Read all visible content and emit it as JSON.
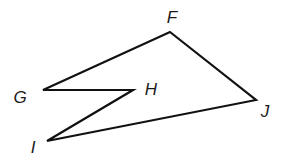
{
  "figure": {
    "type": "polygon",
    "stroke_color": "#111111",
    "stroke_width": 2.2,
    "fill": "none",
    "vertices": [
      {
        "name": "F",
        "x": 170,
        "y": 32,
        "label_x": 172,
        "label_y": 17
      },
      {
        "name": "J",
        "x": 256,
        "y": 100,
        "label_x": 265,
        "label_y": 111
      },
      {
        "name": "I",
        "x": 47,
        "y": 141,
        "label_x": 33,
        "label_y": 147
      },
      {
        "name": "H",
        "x": 133,
        "y": 90,
        "label_x": 151,
        "label_y": 89
      },
      {
        "name": "G",
        "x": 43,
        "y": 90,
        "label_x": 20,
        "label_y": 97
      }
    ],
    "edges": [
      "FJ",
      "JI",
      "IH",
      "HG",
      "GF"
    ]
  },
  "labels": {
    "F": "F",
    "G": "G",
    "H": "H",
    "I": "I",
    "J": "J"
  }
}
